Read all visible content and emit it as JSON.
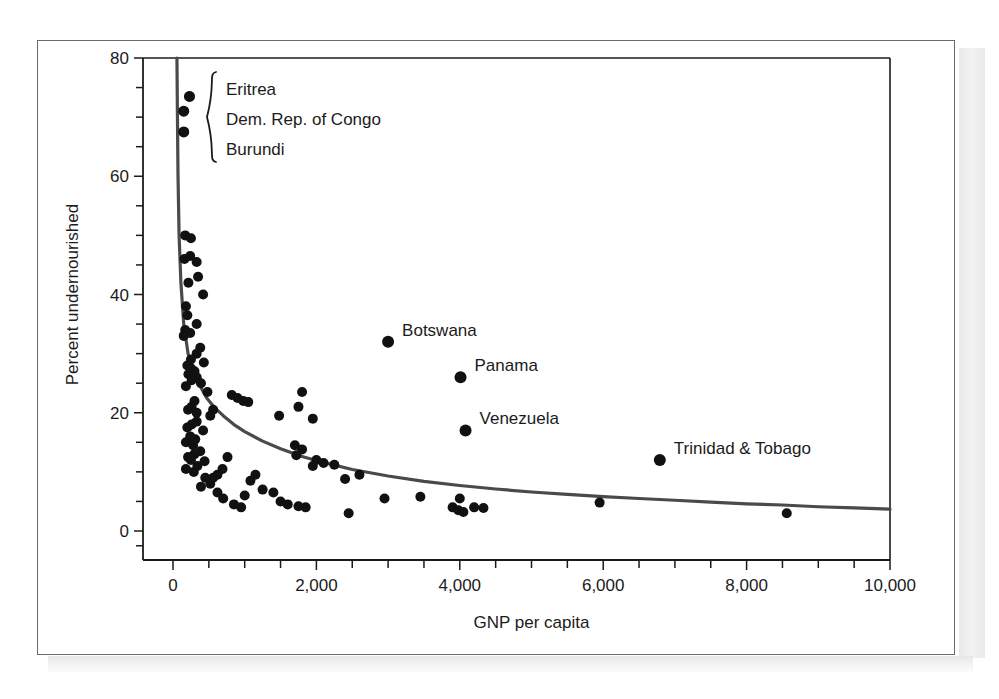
{
  "chart_data": {
    "type": "scatter",
    "title": "",
    "xlabel": "GNP per capita",
    "ylabel": "Percent undernourished",
    "xlim": [
      0,
      10000
    ],
    "ylim": [
      0,
      80
    ],
    "grid": false,
    "legend": null,
    "x_ticks": [
      0,
      2000,
      4000,
      6000,
      8000,
      10000
    ],
    "x_tick_labels": [
      "0",
      "2,000",
      "4,000",
      "6,000",
      "8,000",
      "10,000"
    ],
    "x_minor_step": 500,
    "y_ticks": [
      0,
      20,
      40,
      60,
      80
    ],
    "y_tick_labels": [
      "0",
      "20",
      "40",
      "60",
      "80"
    ],
    "y_minor_step": 5,
    "marker": "filled-circle",
    "marker_color": "#111111",
    "fit_curve": {
      "name": "fitted power curve",
      "color": "#4a4a4a",
      "description": "Steeply decreasing curve flattening toward the right",
      "points": [
        [
          55,
          80
        ],
        [
          62,
          70
        ],
        [
          70,
          60
        ],
        [
          85,
          50
        ],
        [
          110,
          42
        ],
        [
          150,
          35
        ],
        [
          210,
          30
        ],
        [
          290,
          27
        ],
        [
          380,
          24.5
        ],
        [
          470,
          22.5
        ],
        [
          570,
          21
        ],
        [
          700,
          19.5
        ],
        [
          850,
          18
        ],
        [
          1000,
          16.8
        ],
        [
          1250,
          15.2
        ],
        [
          1500,
          13.9
        ],
        [
          1800,
          12.6
        ],
        [
          2100,
          11.6
        ],
        [
          2500,
          10.4
        ],
        [
          3000,
          9.3
        ],
        [
          3500,
          8.4
        ],
        [
          4000,
          7.7
        ],
        [
          4500,
          7.1
        ],
        [
          5000,
          6.6
        ],
        [
          5500,
          6.2
        ],
        [
          6000,
          5.8
        ],
        [
          6500,
          5.5
        ],
        [
          7000,
          5.2
        ],
        [
          7500,
          4.9
        ],
        [
          8000,
          4.6
        ],
        [
          8500,
          4.4
        ],
        [
          9000,
          4.1
        ],
        [
          9500,
          3.9
        ],
        [
          10000,
          3.7
        ]
      ]
    },
    "labeled_points": [
      {
        "name": "Botswana",
        "x": 3000,
        "y": 32.0,
        "label_dx": 14,
        "label_dy": -6
      },
      {
        "name": "Panama",
        "x": 4010,
        "y": 26.0,
        "label_dx": 14,
        "label_dy": -6
      },
      {
        "name": "Venezuela",
        "x": 4080,
        "y": 17.0,
        "label_dx": 14,
        "label_dy": -6
      },
      {
        "name": "Trinidad & Tobago",
        "x": 6790,
        "y": 12.0,
        "label_dx": 14,
        "label_dy": -6
      }
    ],
    "brace_labels": [
      "Eritrea",
      "Dem. Rep. of Congo",
      "Burundi"
    ],
    "brace_points": [
      {
        "name": "Eritrea",
        "x": 230,
        "y": 73.5
      },
      {
        "name": "Dem. Rep. of Congo",
        "x": 150,
        "y": 71.0
      },
      {
        "name": "Burundi",
        "x": 150,
        "y": 67.5
      }
    ],
    "points": [
      [
        230,
        73.5
      ],
      [
        150,
        71.0
      ],
      [
        150,
        67.5
      ],
      [
        170,
        50.0
      ],
      [
        250,
        49.5
      ],
      [
        240,
        46.5
      ],
      [
        160,
        46.0
      ],
      [
        330,
        45.5
      ],
      [
        350,
        43.0
      ],
      [
        215,
        42.0
      ],
      [
        420,
        40.0
      ],
      [
        180,
        38.0
      ],
      [
        200,
        36.5
      ],
      [
        330,
        35.0
      ],
      [
        170,
        34.0
      ],
      [
        240,
        33.5
      ],
      [
        150,
        33.0
      ],
      [
        380,
        31.0
      ],
      [
        330,
        30.0
      ],
      [
        250,
        29.0
      ],
      [
        430,
        28.5
      ],
      [
        200,
        28.0
      ],
      [
        250,
        27.5
      ],
      [
        300,
        27.0
      ],
      [
        215,
        26.5
      ],
      [
        330,
        26.0
      ],
      [
        260,
        25.5
      ],
      [
        390,
        25.0
      ],
      [
        180,
        24.5
      ],
      [
        820,
        23.0
      ],
      [
        900,
        22.5
      ],
      [
        980,
        22.0
      ],
      [
        1050,
        21.8
      ],
      [
        300,
        22.0
      ],
      [
        260,
        21.0
      ],
      [
        210,
        20.5
      ],
      [
        330,
        20.0
      ],
      [
        1800,
        23.5
      ],
      [
        1750,
        21.0
      ],
      [
        1950,
        19.0
      ],
      [
        1480,
        19.5
      ],
      [
        330,
        18.5
      ],
      [
        260,
        18.0
      ],
      [
        200,
        17.5
      ],
      [
        420,
        17.0
      ],
      [
        240,
        16.0
      ],
      [
        310,
        15.5
      ],
      [
        180,
        15.0
      ],
      [
        280,
        14.5
      ],
      [
        1700,
        14.5
      ],
      [
        1800,
        13.8
      ],
      [
        1720,
        12.8
      ],
      [
        2000,
        12.0
      ],
      [
        2100,
        11.5
      ],
      [
        1950,
        11.0
      ],
      [
        2250,
        11.2
      ],
      [
        380,
        13.5
      ],
      [
        300,
        13.0
      ],
      [
        210,
        12.5
      ],
      [
        250,
        12.0
      ],
      [
        440,
        11.8
      ],
      [
        340,
        11.0
      ],
      [
        180,
        10.5
      ],
      [
        290,
        10.0
      ],
      [
        760,
        12.5
      ],
      [
        690,
        10.5
      ],
      [
        620,
        9.5
      ],
      [
        560,
        9.0
      ],
      [
        1150,
        9.5
      ],
      [
        1080,
        8.5
      ],
      [
        1250,
        7.0
      ],
      [
        1400,
        6.5
      ],
      [
        1500,
        5.0
      ],
      [
        1600,
        4.5
      ],
      [
        1750,
        4.2
      ],
      [
        1850,
        4.0
      ],
      [
        2400,
        8.8
      ],
      [
        2600,
        9.5
      ],
      [
        2450,
        3.0
      ],
      [
        2950,
        5.5
      ],
      [
        3450,
        5.8
      ],
      [
        3900,
        4.0
      ],
      [
        3980,
        3.5
      ],
      [
        4050,
        3.2
      ],
      [
        4200,
        4.0
      ],
      [
        4330,
        3.9
      ],
      [
        4000,
        5.5
      ],
      [
        5950,
        4.8
      ],
      [
        8560,
        3.0
      ],
      [
        450,
        9.0
      ],
      [
        520,
        8.0
      ],
      [
        390,
        7.5
      ],
      [
        620,
        6.5
      ],
      [
        700,
        5.5
      ],
      [
        850,
        4.5
      ],
      [
        950,
        4.0
      ],
      [
        1000,
        6.0
      ],
      [
        560,
        20.5
      ],
      [
        480,
        23.5
      ],
      [
        520,
        19.5
      ]
    ]
  }
}
